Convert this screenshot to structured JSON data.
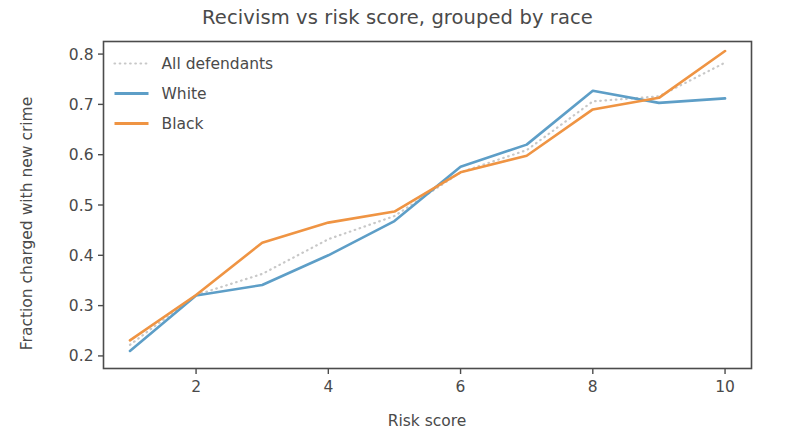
{
  "chart_data": {
    "type": "line",
    "title": "Recivism vs risk score, grouped by race",
    "xlabel": "Risk score",
    "ylabel": "Fraction charged with new crime",
    "x": [
      1,
      2,
      3,
      4,
      5,
      6,
      7,
      8,
      9,
      10
    ],
    "xlim": [
      0.6,
      10.4
    ],
    "ylim": [
      0.175,
      0.825
    ],
    "xticks": [
      2,
      4,
      6,
      8,
      10
    ],
    "xtick_labels": [
      "2",
      "4",
      "6",
      "8",
      "10"
    ],
    "yticks": [
      0.2,
      0.3,
      0.4,
      0.5,
      0.6,
      0.7,
      0.8
    ],
    "ytick_labels": [
      "0.2",
      "0.3",
      "0.4",
      "0.5",
      "0.6",
      "0.7",
      "0.8"
    ],
    "grid": false,
    "legend_position": "upper left",
    "series": [
      {
        "name": "All defendants",
        "style": "dotted",
        "color": "#c8c8c8",
        "values": [
          0.222,
          0.321,
          0.363,
          0.432,
          0.478,
          0.565,
          0.609,
          0.706,
          0.716,
          0.783
        ]
      },
      {
        "name": "White",
        "style": "solid",
        "color": "#5d9ec7",
        "values": [
          0.21,
          0.32,
          0.341,
          0.4,
          0.468,
          0.576,
          0.62,
          0.727,
          0.703,
          0.712
        ]
      },
      {
        "name": "Black",
        "style": "solid",
        "color": "#ef9443",
        "values": [
          0.231,
          0.321,
          0.425,
          0.465,
          0.487,
          0.565,
          0.598,
          0.69,
          0.713,
          0.806
        ]
      }
    ]
  },
  "legend": {
    "entries": [
      {
        "label": "All defendants"
      },
      {
        "label": "White"
      },
      {
        "label": "Black"
      }
    ]
  },
  "icons": {
    "dotted_sample": "dotted-line-swatch",
    "solid_sample": "solid-line-swatch"
  },
  "colors": {
    "white_series": "#5d9ec7",
    "black_series": "#ef9443",
    "all_series": "#c8c8c8",
    "axis": "#4c4c4c",
    "text": "#4a4a4a",
    "background": "#ffffff"
  }
}
